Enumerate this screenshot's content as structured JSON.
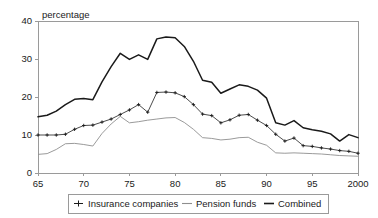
{
  "chart_data": {
    "type": "line",
    "title": "",
    "ylabel": "percentage",
    "xlabel": "",
    "ylim": [
      0,
      40
    ],
    "yticks": [
      0,
      10,
      20,
      30,
      40
    ],
    "xlim": [
      1965,
      2000
    ],
    "xticks": [
      1965,
      1970,
      1975,
      1980,
      1985,
      1990,
      1995,
      2000
    ],
    "xtick_labels": [
      "65",
      "70",
      "75",
      "80",
      "85",
      "90",
      "95",
      "2000"
    ],
    "ytick_labels": [
      "0",
      "10",
      "20",
      "30",
      "40"
    ],
    "grid": false,
    "legend_position": "bottom",
    "x": [
      1965,
      1966,
      1967,
      1968,
      1969,
      1970,
      1971,
      1972,
      1973,
      1974,
      1975,
      1976,
      1977,
      1978,
      1979,
      1980,
      1981,
      1982,
      1983,
      1984,
      1985,
      1986,
      1987,
      1988,
      1989,
      1990,
      1991,
      1992,
      1993,
      1994,
      1995,
      1996,
      1997,
      1998,
      1999,
      2000
    ],
    "series": [
      {
        "name": "Insurance companies",
        "marker": "plus",
        "color": "#1a1a1a",
        "values": [
          10.0,
          10.0,
          10.0,
          10.2,
          11.5,
          12.5,
          12.6,
          13.4,
          14.2,
          15.4,
          16.6,
          18.0,
          16.0,
          21.2,
          21.3,
          21.1,
          20.1,
          18.0,
          15.5,
          15.1,
          13.2,
          14.0,
          15.2,
          15.4,
          13.9,
          12.5,
          10.2,
          8.4,
          9.2,
          7.2,
          7.0,
          6.6,
          6.3,
          5.9,
          5.7,
          5.2
        ]
      },
      {
        "name": "Pension funds",
        "marker": "none",
        "color": "#8e8e8e",
        "values": [
          4.9,
          5.1,
          6.2,
          7.7,
          7.8,
          7.5,
          7.1,
          10.4,
          12.9,
          14.9,
          13.2,
          13.5,
          13.9,
          14.2,
          14.5,
          14.6,
          13.3,
          11.5,
          9.3,
          9.1,
          8.7,
          8.9,
          9.3,
          9.4,
          8.1,
          7.3,
          5.3,
          5.2,
          5.3,
          5.2,
          5.1,
          5.0,
          4.8,
          4.6,
          4.5,
          4.4
        ]
      },
      {
        "name": "Combined",
        "marker": "none",
        "color": "#1a1a1a",
        "values": [
          14.8,
          15.2,
          16.3,
          18.0,
          19.4,
          19.6,
          19.3,
          24.0,
          28.0,
          31.5,
          29.9,
          31.1,
          29.9,
          35.3,
          35.8,
          35.6,
          33.3,
          29.4,
          24.4,
          23.9,
          21.0,
          22.1,
          23.2,
          22.8,
          21.8,
          19.7,
          13.2,
          12.6,
          13.8,
          11.9,
          11.4,
          11.0,
          10.3,
          8.4,
          10.1,
          9.3
        ]
      }
    ]
  },
  "legend": {
    "items": [
      {
        "label": "Insurance companies",
        "marker": "plus-line-marker"
      },
      {
        "label": "Pension funds",
        "marker": "thin-line"
      },
      {
        "label": "Combined",
        "marker": "thick-line"
      }
    ]
  },
  "axis": {
    "y_title": "percentage"
  }
}
